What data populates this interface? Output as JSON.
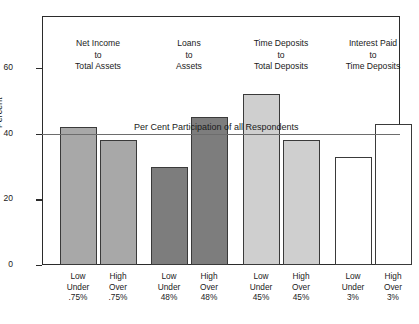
{
  "chart_data": {
    "type": "bar",
    "title": "",
    "xlabel": "",
    "ylabel": "Percent",
    "ylim": [
      0,
      70
    ],
    "yticks": [
      0,
      20,
      40,
      60
    ],
    "ytick_labels": [
      "0",
      "20",
      "40",
      "60"
    ],
    "grid": false,
    "legend": "none",
    "categories": [
      "Low Under .75%",
      "High Over .75%",
      "Low Under 48%",
      "High Over 48%",
      "Low Under 45%",
      "High Over 45%",
      "Low Under 3%",
      "High Over 3%"
    ],
    "values": [
      42,
      38,
      30,
      45,
      52,
      38,
      33,
      43
    ],
    "bar_colors": [
      "#a8a8a8",
      "#a8a8a8",
      "#7d7d7d",
      "#7d7d7d",
      "#cfcfcf",
      "#cfcfcf",
      "#ffffff",
      "#ffffff"
    ],
    "annotations": [
      {
        "type": "hline",
        "value": 40,
        "label": "Per Cent Participation of all Respondents",
        "color": "#6d6d6d"
      }
    ],
    "groups": [
      {
        "caption": [
          "Net Income",
          "to",
          "Total Assets"
        ],
        "bars": [
          {
            "label": [
              "Low",
              "Under",
              ".75%"
            ],
            "value": 42,
            "color": "#a8a8a8"
          },
          {
            "label": [
              "High",
              "Over",
              ".75%"
            ],
            "value": 38,
            "color": "#a8a8a8"
          }
        ]
      },
      {
        "caption": [
          "Loans",
          "to",
          "Assets"
        ],
        "bars": [
          {
            "label": [
              "Low",
              "Under",
              "48%"
            ],
            "value": 30,
            "color": "#7d7d7d"
          },
          {
            "label": [
              "High",
              "Over",
              "48%"
            ],
            "value": 45,
            "color": "#7d7d7d"
          }
        ]
      },
      {
        "caption": [
          "Time Deposits",
          "to",
          "Total Deposits"
        ],
        "bars": [
          {
            "label": [
              "Low",
              "Under",
              "45%"
            ],
            "value": 52,
            "color": "#cfcfcf"
          },
          {
            "label": [
              "High",
              "Over",
              "45%"
            ],
            "value": 38,
            "color": "#cfcfcf"
          }
        ]
      },
      {
        "caption": [
          "Interest Paid",
          "to",
          "Time Deposits"
        ],
        "bars": [
          {
            "label": [
              "Low",
              "Under",
              "3%"
            ],
            "value": 33,
            "color": "#ffffff"
          },
          {
            "label": [
              "High",
              "Over",
              "3%"
            ],
            "value": 43,
            "color": "#ffffff"
          }
        ]
      }
    ]
  },
  "axis": {
    "y_title": "Percent",
    "y_ticks": [
      "60",
      "40",
      "20",
      "0"
    ]
  },
  "reference": {
    "text": "Per Cent Participation of all Respondents"
  },
  "groups": [
    {
      "line1": "Net Income",
      "line2": "to",
      "line3": "Total Assets"
    },
    {
      "line1": "Loans",
      "line2": "to",
      "line3": "Assets"
    },
    {
      "line1": "Time Deposits",
      "line2": "to",
      "line3": "Total Deposits"
    },
    {
      "line1": "Interest Paid",
      "line2": "to",
      "line3": "Time Deposits"
    }
  ],
  "xlabels": [
    {
      "line1": "Low",
      "line2": "Under",
      "line3": ".75%"
    },
    {
      "line1": "High",
      "line2": "Over",
      "line3": ".75%"
    },
    {
      "line1": "Low",
      "line2": "Under",
      "line3": "48%"
    },
    {
      "line1": "High",
      "line2": "Over",
      "line3": "48%"
    },
    {
      "line1": "Low",
      "line2": "Under",
      "line3": "45%"
    },
    {
      "line1": "High",
      "line2": "Over",
      "line3": "45%"
    },
    {
      "line1": "Low",
      "line2": "Under",
      "line3": "3%"
    },
    {
      "line1": "High",
      "line2": "Over",
      "line3": "3%"
    }
  ]
}
